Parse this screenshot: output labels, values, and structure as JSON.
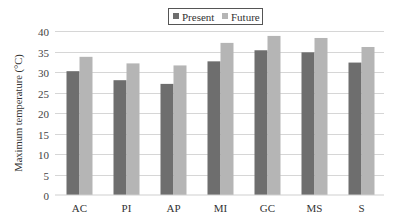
{
  "chart_data": {
    "type": "bar",
    "title": "",
    "xlabel": "",
    "ylabel": "Maximum temperature (°C)",
    "ylim": [
      0,
      40
    ],
    "yticks": [
      0,
      5,
      10,
      15,
      20,
      25,
      30,
      35,
      40
    ],
    "grid": true,
    "legend_position": "top-center",
    "categories": [
      "AC",
      "PI",
      "AP",
      "MI",
      "GC",
      "MS",
      "S"
    ],
    "series": [
      {
        "name": "Present",
        "color": "#6e6e6e",
        "values": [
          30.2,
          28.0,
          27.1,
          32.6,
          35.3,
          34.8,
          32.3
        ]
      },
      {
        "name": "Future",
        "color": "#b5b5b5",
        "values": [
          33.7,
          32.1,
          31.6,
          37.1,
          38.8,
          38.3,
          36.1
        ]
      }
    ]
  }
}
